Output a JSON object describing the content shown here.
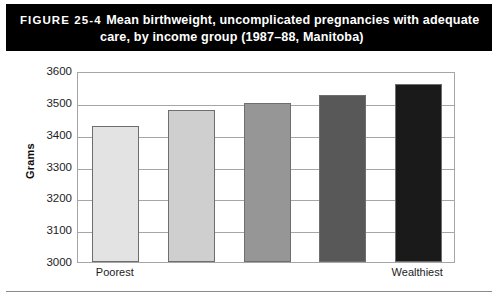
{
  "figure": {
    "number_label": "FIGURE 25-4",
    "title_line1": "Mean birthweight, uncomplicated pregnancies with adequate",
    "title_line2": "care, by income group (1987–88, Manitoba)",
    "banner_color": "#000000",
    "banner_text_color": "#ffffff"
  },
  "chart_data": {
    "type": "bar",
    "title": "Mean birthweight, uncomplicated pregnancies with adequate care, by income group (1987–88, Manitoba)",
    "xlabel": "",
    "ylabel": "Grams",
    "ylim": [
      3000,
      3600
    ],
    "ytick_step": 100,
    "yticks": [
      3600,
      3500,
      3400,
      3300,
      3200,
      3100,
      3000
    ],
    "ytick_labels": [
      "3600",
      "3500",
      "3400",
      "3300",
      "3200",
      "3100",
      "3000"
    ],
    "categories": [
      "Poorest",
      "",
      "",
      "",
      "Wealthiest"
    ],
    "xtick_labels": [
      "Poorest",
      "Wealthiest"
    ],
    "values": [
      3428,
      3478,
      3500,
      3525,
      3560
    ],
    "bar_colors": [
      "#e3e3e3",
      "#cfcfcf",
      "#969696",
      "#585858",
      "#1a1a1a"
    ],
    "bar_border_color": "#6e6e6e",
    "grid": true,
    "gridline_color": "#a6a6a6",
    "legend": null,
    "legend_position": "none"
  }
}
